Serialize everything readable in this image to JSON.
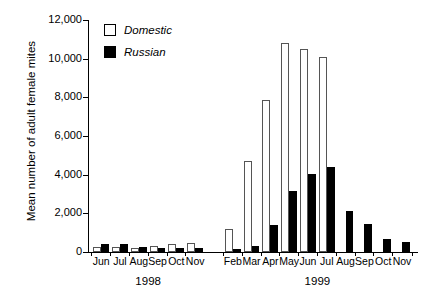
{
  "chart_data": {
    "type": "bar",
    "title": "",
    "xlabel": "",
    "ylabel": "Mean number of adult female mites",
    "ylim": [
      0,
      12000
    ],
    "ytick_values": [
      0,
      2000,
      4000,
      6000,
      8000,
      10000,
      12000
    ],
    "ytick_labels": [
      "0",
      "2,000",
      "4,000",
      "6,000",
      "8,000",
      "10,000",
      "12,000"
    ],
    "grid": false,
    "legend_position": "top-left",
    "legend": [
      "Domestic",
      "Russian"
    ],
    "group_labels": [
      "1998",
      "1999"
    ],
    "categories": [
      "Jun",
      "Jul",
      "Aug",
      "Sep",
      "Oct",
      "Nov",
      "Feb",
      "Mar",
      "Apr",
      "May",
      "Jun",
      "Jul",
      "Aug",
      "Sep",
      "Oct",
      "Nov"
    ],
    "category_years": [
      "1998",
      "1998",
      "1998",
      "1998",
      "1998",
      "1998",
      "1999",
      "1999",
      "1999",
      "1999",
      "1999",
      "1999",
      "1999",
      "1999",
      "1999",
      "1999"
    ],
    "series": [
      {
        "name": "Domestic",
        "color": "#ffffff",
        "values": [
          250,
          280,
          200,
          330,
          420,
          480,
          1200,
          4700,
          7850,
          10800,
          10500,
          10100,
          0,
          0,
          0,
          0
        ]
      },
      {
        "name": "Russian",
        "color": "#000000",
        "values": [
          430,
          420,
          250,
          190,
          230,
          200,
          180,
          330,
          1400,
          3150,
          4050,
          4400,
          2100,
          1450,
          660,
          520
        ]
      }
    ]
  },
  "legend": {
    "items": [
      {
        "label": "Domestic",
        "swatch": "open-square"
      },
      {
        "label": "Russian",
        "swatch": "filled-square"
      }
    ]
  },
  "axes": {
    "y_title": "Mean number of adult female mites"
  }
}
